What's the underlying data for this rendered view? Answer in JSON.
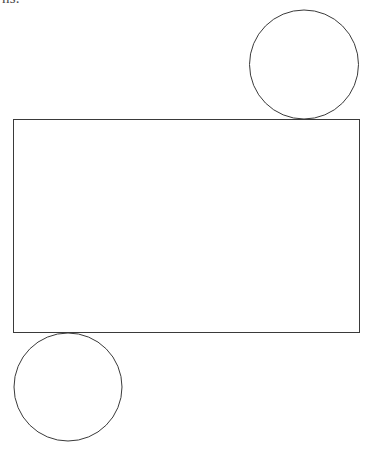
{
  "page": {
    "width": 369,
    "height": 461,
    "background_color": "#ffffff"
  },
  "header_fragment": {
    "text": "ns.",
    "note": "partially clipped text fragment at top-left edge",
    "color": "#4a4a4a"
  },
  "figure": {
    "stroke_color": "#3a3a3a",
    "stroke_width": 1,
    "fill": "none",
    "shapes": [
      {
        "name": "rectangle",
        "type": "rect",
        "x": 13,
        "y": 119,
        "width": 346,
        "height": 213
      },
      {
        "name": "top-right-circle",
        "type": "circle",
        "cx": 304,
        "cy": 64.5,
        "r": 54.5,
        "tangent_to": "rectangle-top-edge"
      },
      {
        "name": "bottom-left-circle",
        "type": "circle",
        "cx": 68,
        "cy": 387,
        "r": 54,
        "tangent_to": "rectangle-bottom-edge"
      }
    ]
  }
}
